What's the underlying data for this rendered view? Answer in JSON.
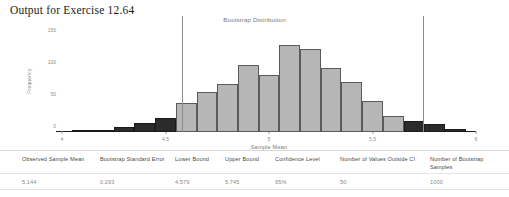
{
  "page": {
    "title": "Output for Exercise 12.64"
  },
  "chart_data": {
    "type": "bar",
    "title": "Bootstrap Distribution",
    "xlabel": "Sample Mean",
    "ylabel": "Frequency",
    "grid": false,
    "legend": "none",
    "xlim": [
      4.0,
      6.0
    ],
    "ylim": [
      0,
      160
    ],
    "xticks": [
      "4",
      "4.5",
      "5",
      "5.5",
      "6"
    ],
    "xtick_values": [
      4,
      4.5,
      5,
      5.5,
      6
    ],
    "yticks": [
      "0",
      "50",
      "100",
      "150"
    ],
    "ytick_values": [
      0,
      50,
      100,
      150
    ],
    "bin_width": 0.1,
    "categories": [
      "4.1",
      "4.2",
      "4.3",
      "4.4",
      "4.5",
      "4.6",
      "4.7",
      "4.8",
      "4.9",
      "5.0",
      "5.1",
      "5.2",
      "5.3",
      "5.4",
      "5.5",
      "5.6",
      "5.7",
      "5.8",
      "5.9"
    ],
    "bin_starts": [
      4.05,
      4.15,
      4.25,
      4.35,
      4.45,
      4.55,
      4.65,
      4.75,
      4.85,
      4.95,
      5.05,
      5.15,
      5.25,
      5.35,
      5.45,
      5.55,
      5.65,
      5.75,
      5.85
    ],
    "values": [
      1,
      3,
      8,
      14,
      22,
      45,
      62,
      75,
      105,
      90,
      136,
      130,
      100,
      78,
      48,
      25,
      18,
      12,
      4
    ],
    "bar_classes": [
      "outside",
      "outside",
      "outside",
      "outside",
      "outside",
      "inside",
      "inside",
      "inside",
      "inside",
      "inside",
      "inside",
      "inside",
      "inside",
      "inside",
      "inside",
      "inside",
      "outside",
      "outside",
      "outside"
    ],
    "ci_lines": [
      4.579,
      5.745
    ],
    "annotations": {
      "lower_bound_line": 4.579,
      "upper_bound_line": 5.745
    }
  },
  "table": {
    "headers": [
      "Observed Sample Mean",
      "Bootstrap Standard Error",
      "Lower Bound",
      "Upper Bound",
      "Confidence Level",
      "Number of Values Outside CI",
      "Number of Bootstrap Samples"
    ],
    "values": [
      "5.144",
      "0.293",
      "4.579",
      "5.745",
      "95%",
      "50",
      "1000"
    ]
  },
  "colors": {
    "bar_inside": "#b6b6b6",
    "bar_outside": "#2b2b2b",
    "axis": "#1d1d1d",
    "ci_line": "#8a8a8a",
    "text": "#6d6d6d"
  }
}
